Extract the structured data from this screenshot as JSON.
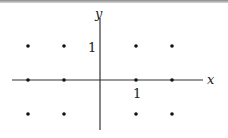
{
  "diagram": {
    "type": "integer lattice points on coordinate plane",
    "axes": {
      "x_label": "x",
      "y_label": "y"
    },
    "tick_labels": {
      "x_unit": "1",
      "y_unit": "1"
    },
    "points": [
      {
        "x": -2,
        "y": 1
      },
      {
        "x": -1,
        "y": 1
      },
      {
        "x": 1,
        "y": 1
      },
      {
        "x": 2,
        "y": 1
      },
      {
        "x": -2,
        "y": 0
      },
      {
        "x": -1,
        "y": 0
      },
      {
        "x": 1,
        "y": 0
      },
      {
        "x": 2,
        "y": 0
      },
      {
        "x": -2,
        "y": -1
      },
      {
        "x": -1,
        "y": -1
      },
      {
        "x": 1,
        "y": -1
      },
      {
        "x": 2,
        "y": -1
      }
    ],
    "colors": {
      "axis": "#333333",
      "point": "#111111"
    }
  }
}
